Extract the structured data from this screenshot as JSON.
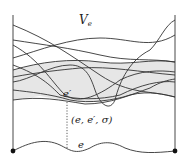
{
  "diagram": {
    "title_label": "V",
    "title_subscript": "e",
    "edge_prime_label": "e′",
    "triple_label": "(e, e′, σ)",
    "edge_label": "e",
    "colors": {
      "stroke": "#333333",
      "shade": "#e6e6e6",
      "vertex": "#111111"
    }
  }
}
